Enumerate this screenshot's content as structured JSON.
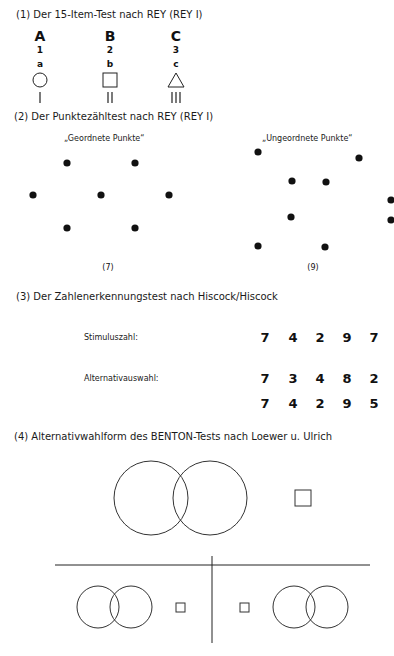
{
  "sections": {
    "s1": {
      "heading": "(1) Der 15-Item-Test nach REY (REY I)",
      "columns": [
        {
          "letter": "A",
          "number": "1",
          "small": "a",
          "shape": "circle",
          "strokes": "|"
        },
        {
          "letter": "B",
          "number": "2",
          "small": "b",
          "shape": "square",
          "strokes": "||"
        },
        {
          "letter": "C",
          "number": "3",
          "small": "c",
          "shape": "triangle",
          "strokes": "|||"
        }
      ]
    },
    "s2": {
      "heading": "(2) Der Punktezähltest nach REY (REY I)",
      "ordered": {
        "title": "„Geordnete Punkte“",
        "count_label": "(7)",
        "dots": [
          [
            67,
            163
          ],
          [
            135,
            163
          ],
          [
            33,
            195
          ],
          [
            101,
            195
          ],
          [
            169,
            195
          ],
          [
            67,
            228
          ],
          [
            135,
            228
          ]
        ]
      },
      "unordered": {
        "title": "„Ungeordnete Punkte“",
        "count_label": "(9)",
        "dots": [
          [
            258,
            152
          ],
          [
            359,
            158
          ],
          [
            292,
            181
          ],
          [
            326,
            182
          ],
          [
            391,
            200
          ],
          [
            291,
            217
          ],
          [
            391,
            220
          ],
          [
            258,
            246
          ],
          [
            325,
            247
          ]
        ]
      }
    },
    "s3": {
      "heading": "(3) Der Zahlenerkennungstest nach Hiscock/Hiscock",
      "stimulus_label": "Stimuluszahl:",
      "stimulus": [
        "7",
        "4",
        "2",
        "9",
        "7"
      ],
      "alternative_label": "Alternativauswahl:",
      "alternative_1": [
        "7",
        "3",
        "4",
        "8",
        "2"
      ],
      "alternative_2": [
        "7",
        "4",
        "2",
        "9",
        "5"
      ]
    },
    "s4": {
      "heading": "(4) Alternativwahlform des BENTON-Tests nach Loewer u. Ulrich"
    }
  }
}
